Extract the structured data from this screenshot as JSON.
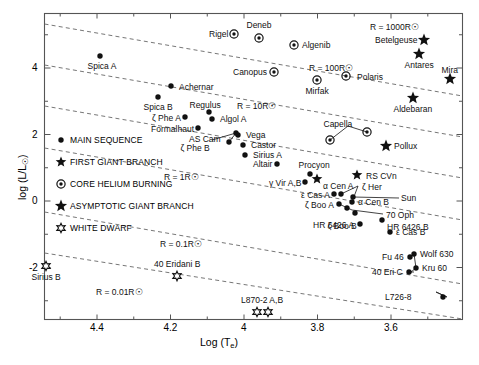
{
  "chart_data": {
    "type": "scatter",
    "title": "",
    "xlabel": "Log (Te)",
    "ylabel": "log (L/Lsun)",
    "xlim": [
      4.52,
      3.33
    ],
    "ylim": [
      -3.05,
      5.35
    ],
    "xticks": [
      4.4,
      4.2,
      4.0,
      3.8,
      3.6
    ],
    "xticklabels": [
      "4.4",
      "4.2",
      "4",
      "3.8",
      "3.6"
    ],
    "yticks": [
      4,
      2,
      0,
      -2
    ],
    "yticklabels": [
      "4",
      "2",
      "0",
      "-2"
    ],
    "grid": false,
    "legend_position": "center-left",
    "legend": [
      {
        "marker": "dot",
        "label": "MAIN SEQUENCE"
      },
      {
        "marker": "star5",
        "label": "FIRST GIANT BRANCH"
      },
      {
        "marker": "circledot",
        "label": "CORE HELIUM BURNING"
      },
      {
        "marker": "star5bold",
        "label": "ASYMPTOTIC GIANT BRANCH"
      },
      {
        "marker": "star6open",
        "label": "WHITE DWARF"
      }
    ],
    "radius_lines": [
      {
        "label": "R = 1000R☉",
        "x": 370,
        "y": 22
      },
      {
        "label": "R = 100R☉",
        "x": 309,
        "y": 63
      },
      {
        "label": "R = 10R☉",
        "x": 237,
        "y": 101
      },
      {
        "label": "R = 1R☉",
        "x": 164,
        "y": 172
      },
      {
        "label": "R = 0.1R☉",
        "x": 160,
        "y": 239
      },
      {
        "label": "R = 0.01R☉",
        "x": 96,
        "y": 287
      }
    ],
    "points": [
      {
        "name": "Spica A",
        "marker": "dot",
        "x": 100,
        "y": 56,
        "lx": 102,
        "ly": 67,
        "anchor": "middle"
      },
      {
        "name": "Achernar",
        "marker": "dot",
        "x": 171,
        "y": 86,
        "lx": 179,
        "ly": 88,
        "anchor": "start"
      },
      {
        "name": "Spica B",
        "marker": "dot",
        "x": 158,
        "y": 97,
        "lx": 158,
        "ly": 108,
        "anchor": "middle"
      },
      {
        "name": "Regulus",
        "marker": "dot",
        "x": 209,
        "y": 112,
        "lx": 205,
        "ly": 106,
        "anchor": "middle"
      },
      {
        "name": "ζ Phe A",
        "marker": "dot",
        "x": 185,
        "y": 117,
        "lx": 181,
        "ly": 119,
        "anchor": "end"
      },
      {
        "name": "Algol A",
        "marker": "dot",
        "x": 212,
        "y": 119,
        "lx": 220,
        "ly": 120,
        "anchor": "start"
      },
      {
        "name": "Formalhaut",
        "marker": "dot",
        "x": 198,
        "y": 128,
        "lx": 194,
        "ly": 130,
        "anchor": "end"
      },
      {
        "name": "AS Cam",
        "marker": "dot",
        "x": 236,
        "y": 133,
        "lx": 205,
        "ly": 140,
        "anchor": "middle"
      },
      {
        "name": "ζ Phe B",
        "marker": "dot",
        "x": 229,
        "y": 142,
        "lx": 195,
        "ly": 149,
        "anchor": "middle"
      },
      {
        "name": "Vega",
        "marker": "dot",
        "x": 238,
        "y": 135,
        "lx": 246,
        "ly": 136,
        "anchor": "start"
      },
      {
        "name": "Castor",
        "marker": "dot",
        "x": 243,
        "y": 145,
        "lx": 251,
        "ly": 146,
        "anchor": "start"
      },
      {
        "name": "Sirius A",
        "marker": "dot",
        "x": 245,
        "y": 155,
        "lx": 253,
        "ly": 156,
        "anchor": "start"
      },
      {
        "name": "Altair",
        "marker": "dot",
        "x": 277,
        "y": 164,
        "lx": 272,
        "ly": 165,
        "anchor": "end"
      },
      {
        "name": "Procyon",
        "marker": "dot",
        "x": 310,
        "y": 174,
        "lx": 314,
        "ly": 166,
        "anchor": "middle"
      },
      {
        "name": "γ Vir A,B",
        "marker": "dot",
        "x": 305,
        "y": 182,
        "lx": 301,
        "ly": 184,
        "anchor": "end"
      },
      {
        "name": "ε Cas A",
        "marker": "dot",
        "x": 334,
        "y": 194,
        "lx": 330,
        "ly": 196,
        "anchor": "end"
      },
      {
        "name": "α Cen A",
        "marker": "dot",
        "x": 341,
        "y": 194,
        "lx": 338,
        "ly": 187,
        "anchor": "middle"
      },
      {
        "name": "α Cen B",
        "marker": "dot",
        "x": 352,
        "y": 202,
        "lx": 358,
        "ly": 203,
        "anchor": "start"
      },
      {
        "name": "ζ Boo A",
        "marker": "dot",
        "x": 339,
        "y": 204,
        "lx": 334,
        "ly": 206,
        "anchor": "end"
      },
      {
        "name": "ζ Boo B",
        "marker": "dot",
        "x": 347,
        "y": 208,
        "lx": 342,
        "ly": 227,
        "anchor": "middle"
      },
      {
        "name": "Sun",
        "marker": "dot",
        "x": 353,
        "y": 197,
        "lx": 401,
        "ly": 199,
        "anchor": "start"
      },
      {
        "name": "ζ Her",
        "marker": "star5",
        "x": 317,
        "y": 179,
        "lx": 362,
        "ly": 188,
        "anchor": "start"
      },
      {
        "name": "RS CVn",
        "marker": "star5",
        "x": 357,
        "y": 175,
        "lx": 366,
        "ly": 177,
        "anchor": "start"
      },
      {
        "name": "70 Oph",
        "marker": "dot",
        "x": 355,
        "y": 213,
        "lx": 386,
        "ly": 216,
        "anchor": "start"
      },
      {
        "name": "HR 6426 A",
        "marker": "dot",
        "x": 360,
        "y": 224,
        "lx": 354,
        "ly": 226,
        "anchor": "end"
      },
      {
        "name": "HR 6426 B",
        "marker": "dot",
        "x": 382,
        "y": 220,
        "lx": 387,
        "ly": 228,
        "anchor": "start"
      },
      {
        "name": "ε Cas B",
        "marker": "dot",
        "x": 390,
        "y": 232,
        "lx": 396,
        "ly": 233,
        "anchor": "start"
      },
      {
        "name": "Fu 46",
        "marker": "dot",
        "x": 410,
        "y": 257,
        "lx": 404,
        "ly": 258,
        "anchor": "end"
      },
      {
        "name": "Wolf 630",
        "marker": "dot",
        "x": 414,
        "y": 254,
        "lx": 420,
        "ly": 255,
        "anchor": "start"
      },
      {
        "name": "Kru 60",
        "marker": "dot",
        "x": 416,
        "y": 268,
        "lx": 422,
        "ly": 269,
        "anchor": "start"
      },
      {
        "name": "40 Eri C",
        "marker": "dot",
        "x": 409,
        "y": 272,
        "lx": 403,
        "ly": 273,
        "anchor": "end"
      },
      {
        "name": "L726-8",
        "marker": "dot",
        "x": 443,
        "y": 297,
        "lx": 411,
        "ly": 298,
        "anchor": "end"
      },
      {
        "name": "Rigel",
        "marker": "circledot",
        "x": 234,
        "y": 34,
        "lx": 228,
        "ly": 35,
        "anchor": "end"
      },
      {
        "name": "Deneb",
        "marker": "circledot",
        "x": 259,
        "y": 38,
        "lx": 259,
        "ly": 26,
        "anchor": "middle"
      },
      {
        "name": "Algenib",
        "marker": "circledot",
        "x": 294,
        "y": 45,
        "lx": 302,
        "ly": 46,
        "anchor": "start"
      },
      {
        "name": "Canopus",
        "marker": "circledot",
        "x": 274,
        "y": 72,
        "lx": 267,
        "ly": 73,
        "anchor": "end"
      },
      {
        "name": "Mirfak",
        "marker": "circledot",
        "x": 317,
        "y": 80,
        "lx": 317,
        "ly": 92,
        "anchor": "middle"
      },
      {
        "name": "Polaris",
        "marker": "circledot",
        "x": 346,
        "y": 76,
        "lx": 357,
        "ly": 78,
        "anchor": "start"
      },
      {
        "name": "Capella",
        "marker": "circledot",
        "x": 330,
        "y": 140,
        "lx": 338,
        "ly": 125,
        "anchor": "middle"
      },
      {
        "name": "Capella B",
        "marker": "circledot",
        "x": 367,
        "y": 132,
        "lx": 0,
        "ly": 0,
        "anchor": "none"
      },
      {
        "name": "Betelgeuse",
        "marker": "star5bold",
        "x": 424,
        "y": 40,
        "lx": 418,
        "ly": 41,
        "anchor": "end"
      },
      {
        "name": "Antares",
        "marker": "star5bold",
        "x": 419,
        "y": 54,
        "lx": 419,
        "ly": 66,
        "anchor": "middle"
      },
      {
        "name": "Mira",
        "marker": "star5bold",
        "x": 450,
        "y": 79,
        "lx": 450,
        "ly": 71,
        "anchor": "middle"
      },
      {
        "name": "Aldebaran",
        "marker": "star5bold",
        "x": 413,
        "y": 98,
        "lx": 413,
        "ly": 110,
        "anchor": "middle"
      },
      {
        "name": "Pollux",
        "marker": "star5bold",
        "x": 386,
        "y": 146,
        "lx": 394,
        "ly": 147,
        "anchor": "start"
      },
      {
        "name": "Sirius B",
        "marker": "star6open",
        "x": 46,
        "y": 266,
        "lx": 46,
        "ly": 278,
        "anchor": "middle"
      },
      {
        "name": "40 Eridani B",
        "marker": "star6open",
        "x": 177,
        "y": 276,
        "lx": 177,
        "ly": 265,
        "anchor": "middle"
      },
      {
        "name": "L870-2 A,B",
        "marker": "star6open",
        "x": 257,
        "y": 312,
        "lx": 262,
        "ly": 301,
        "anchor": "middle"
      },
      {
        "name": "L870-2 B",
        "marker": "star6open",
        "x": 268,
        "y": 312,
        "lx": 0,
        "ly": 0,
        "anchor": "none"
      }
    ]
  },
  "colors": {
    "ink": "#111111",
    "frame": "#555555",
    "dashed": "#666666",
    "background": "#ffffff"
  }
}
